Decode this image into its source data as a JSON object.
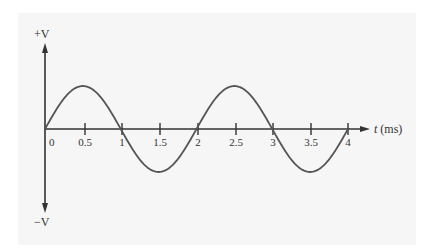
{
  "chart_data": {
    "type": "line",
    "title": "",
    "xlabel": "t (ms)",
    "ylabel_top": "+V",
    "ylabel_bottom": "−V",
    "x_ticks": [
      "0",
      "0.5",
      "1",
      "1.5",
      "2",
      "2.5",
      "3",
      "3.5",
      "4"
    ],
    "xlim": [
      0,
      4
    ],
    "ylim": [
      -1,
      1
    ],
    "grid": false,
    "legend": null,
    "series": [
      {
        "name": "sine wave",
        "function": "sin(2*pi*t/2)",
        "period_ms": 2,
        "amplitude": "V",
        "x": [
          0,
          0.5,
          1,
          1.5,
          2,
          2.5,
          3,
          3.5,
          4
        ],
        "values": [
          0,
          1,
          0,
          -1,
          0,
          1,
          0,
          -1,
          0
        ]
      }
    ]
  },
  "colors": {
    "panel": "#f6f6f6",
    "axis": "#333333",
    "curve": "#555555"
  },
  "labels": {
    "y_top": "+V",
    "y_bottom": "−V",
    "x_axis_t": "t",
    "x_axis_unit": " (ms)",
    "ticks": [
      "0",
      "0.5",
      "1",
      "1.5",
      "2",
      "2.5",
      "3",
      "3.5",
      "4"
    ]
  }
}
